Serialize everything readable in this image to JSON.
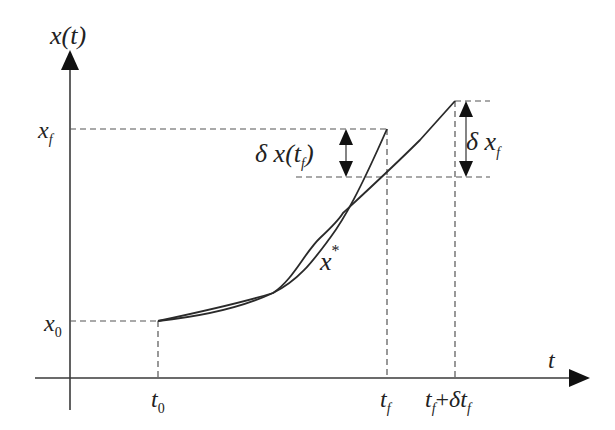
{
  "diagram": {
    "axes": {
      "y_label": "x(t)",
      "x_label": "t"
    },
    "y_ticks": {
      "x0": {
        "base": "x",
        "sub": "0"
      },
      "xf": {
        "base": "x",
        "sub": "f"
      }
    },
    "x_ticks": {
      "t0": {
        "base": "t",
        "sub": "0"
      },
      "tf": {
        "base": "t",
        "sub": "f"
      },
      "tf_plus": {
        "base1": "t",
        "sub1": "f",
        "plus": "+",
        "delta": "δ",
        "base2": "t",
        "sub2": "f"
      }
    },
    "annotations": {
      "delta_x_tf": {
        "prefix": "δ x(t",
        "sub": "f",
        "suffix": ")"
      },
      "delta_xf": {
        "prefix": "δ x",
        "sub": "f"
      },
      "optimal_curve": {
        "base": "x",
        "sup": "*"
      }
    },
    "curves": [
      {
        "name": "optimal-trajectory",
        "label": "x*",
        "description": "ends at (t_f, x_f)"
      },
      {
        "name": "perturbed-trajectory",
        "label": "x* + δx",
        "description": "ends at (t_f + δt_f, x_f + δx_f)"
      }
    ],
    "colors": {
      "line": "#2a2a2a",
      "dash": "#555555",
      "background": "#ffffff"
    }
  }
}
